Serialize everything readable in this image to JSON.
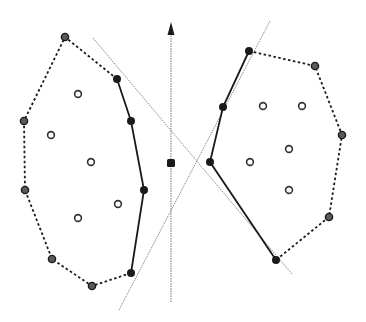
{
  "figure": {
    "width": 366,
    "height": 322,
    "background": "#ffffff",
    "colors": {
      "ink": "#1a1a1a",
      "guide": "#8a8a8a",
      "hull_vertex": "#5a5a5a",
      "hollow_stroke": "#333333"
    },
    "axis_arrow": {
      "x": 171,
      "y_bottom": 302,
      "y_top": 22
    },
    "center_point": {
      "x": 171,
      "y": 163
    },
    "tangent_lines": [
      {
        "name": "tangent-line-1",
        "x1": 93,
        "y1": 38,
        "x2": 292,
        "y2": 274
      },
      {
        "name": "tangent-line-2",
        "x1": 270,
        "y1": 21,
        "x2": 119,
        "y2": 310
      }
    ],
    "left_set": {
      "hull_dashed": [
        [
          117,
          79
        ],
        [
          65,
          37
        ],
        [
          24,
          121
        ],
        [
          25,
          190
        ],
        [
          52,
          259
        ],
        [
          92,
          286
        ],
        [
          131,
          273
        ]
      ],
      "chain_solid": [
        [
          117,
          79
        ],
        [
          131,
          121
        ],
        [
          144,
          190
        ],
        [
          131,
          273
        ]
      ],
      "hull_vertices": [
        [
          65,
          37
        ],
        [
          24,
          121
        ],
        [
          25,
          190
        ],
        [
          52,
          259
        ],
        [
          92,
          286
        ]
      ],
      "chain_vertices": [
        [
          117,
          79
        ],
        [
          131,
          121
        ],
        [
          144,
          190
        ],
        [
          131,
          273
        ]
      ],
      "interior_points": [
        [
          78,
          94
        ],
        [
          51,
          135
        ],
        [
          91,
          162
        ],
        [
          118,
          204
        ],
        [
          78,
          218
        ]
      ]
    },
    "right_set": {
      "hull_dashed": [
        [
          249,
          51
        ],
        [
          315,
          66
        ],
        [
          342,
          135
        ],
        [
          329,
          217
        ],
        [
          276,
          260
        ]
      ],
      "chain_solid": [
        [
          249,
          51
        ],
        [
          223,
          107
        ],
        [
          210,
          162
        ],
        [
          276,
          260
        ]
      ],
      "hull_vertices": [
        [
          315,
          66
        ],
        [
          342,
          135
        ],
        [
          329,
          217
        ]
      ],
      "chain_vertices": [
        [
          249,
          51
        ],
        [
          223,
          107
        ],
        [
          210,
          162
        ],
        [
          276,
          260
        ]
      ],
      "interior_points": [
        [
          263,
          106
        ],
        [
          302,
          106
        ],
        [
          289,
          149
        ],
        [
          250,
          162
        ],
        [
          289,
          190
        ]
      ]
    }
  }
}
